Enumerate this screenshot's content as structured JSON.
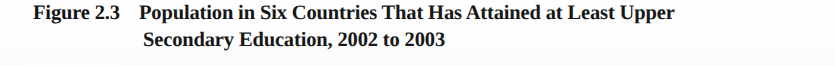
{
  "page": {
    "background_color": "#fefefe",
    "text_color": "#171717"
  },
  "figure_caption": {
    "label": "Figure 2.3",
    "line_1": "Population in Six Countries That Has Attained at Least Upper",
    "line_2": "Secondary Education, 2002 to 2003",
    "full_title": "Population in Six Countries That Has Attained at Least Upper Secondary Education, 2002 to 2003",
    "figure_number": "2.3",
    "years": "2002 to 2003"
  }
}
